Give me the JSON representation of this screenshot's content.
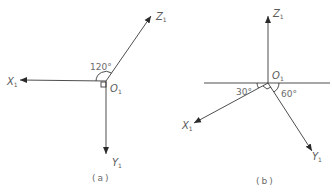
{
  "diagram_a": {
    "caption": "(a)",
    "origin_label": "O",
    "origin_sub": "1",
    "angle_label": "120°",
    "axes": {
      "x": {
        "label": "X",
        "sub": "1"
      },
      "y": {
        "label": "Y",
        "sub": "1"
      },
      "z": {
        "label": "Z",
        "sub": "1"
      }
    }
  },
  "diagram_b": {
    "caption": "(b)",
    "origin_label": "O",
    "origin_sub": "1",
    "angle_left_label": "30°",
    "angle_right_label": "60°",
    "axes": {
      "x": {
        "label": "X",
        "sub": "1"
      },
      "y": {
        "label": "Y",
        "sub": "1"
      },
      "z": {
        "label": "Z",
        "sub": "1"
      }
    }
  },
  "colors": {
    "line": "#3a3a3a",
    "text": "#5a5a5a"
  }
}
